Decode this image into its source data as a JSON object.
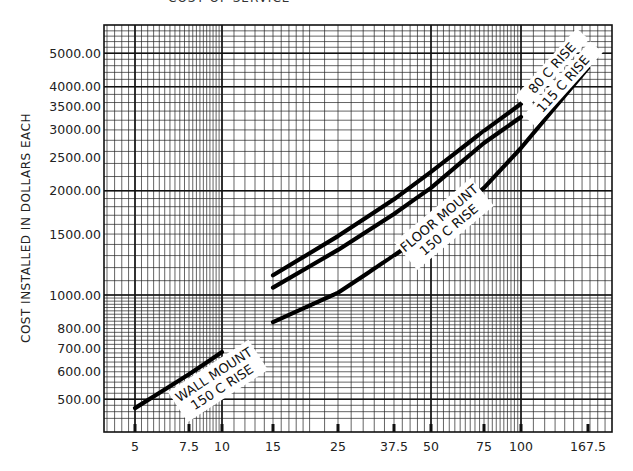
{
  "title_clipped": "COST OF SERVICE",
  "chart_data": {
    "type": "line",
    "title": "",
    "xlabel": "",
    "ylabel": "COST INSTALLED IN DOLLARS EACH",
    "x_scale": "log",
    "y_scale": "log",
    "grid": true,
    "xlim": [
      4,
      200
    ],
    "ylim": [
      420,
      6000
    ],
    "x_ticks": [
      5,
      7.5,
      10,
      15,
      25,
      37.5,
      50,
      75,
      100,
      167.5
    ],
    "x_tick_labels": [
      "5",
      "7.5",
      "10",
      "15",
      "25",
      "37.5",
      "50",
      "75",
      "100",
      "167.5"
    ],
    "y_ticks": [
      500,
      600,
      700,
      800,
      1000,
      1500,
      2000,
      2500,
      3000,
      3500,
      4000,
      5000
    ],
    "y_tick_labels": [
      "500.00",
      "600.00",
      "700.00",
      "800.00",
      "1000.00",
      "1500.00",
      "2000.00",
      "2500.00",
      "3000.00",
      "3500.00",
      "4000.00",
      "5000.00"
    ],
    "series": [
      {
        "name": "WALL MOUNT 150 C RISE",
        "label_lines": [
          "WALL MOUNT",
          "150 C RISE"
        ],
        "x": [
          5,
          7.5,
          10
        ],
        "values": [
          471,
          590,
          684
        ]
      },
      {
        "name": "80 C RISE",
        "label_lines": [
          "80 C RISE"
        ],
        "x": [
          15,
          25,
          37.5,
          50,
          75,
          100
        ],
        "values": [
          1140,
          1480,
          1890,
          2270,
          2980,
          3570
        ]
      },
      {
        "name": "115 C RISE",
        "label_lines": [
          "115 C RISE"
        ],
        "x": [
          15,
          25,
          37.5,
          50,
          75,
          100
        ],
        "values": [
          1050,
          1350,
          1715,
          2040,
          2750,
          3270
        ]
      },
      {
        "name": "FLOOR MOUNT 150 C RISE",
        "label_lines": [
          "FLOOR MOUNT",
          "150 C RISE"
        ],
        "x": [
          15,
          25,
          37.5,
          50,
          75,
          100,
          167.5
        ],
        "values": [
          835,
          1015,
          1300,
          1540,
          2040,
          2660,
          4530
        ]
      }
    ],
    "legend": "inline labels on curves"
  }
}
